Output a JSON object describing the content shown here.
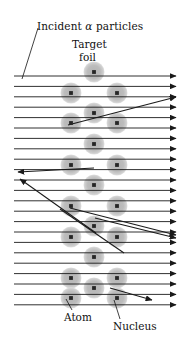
{
  "figure": {
    "labels": {
      "incident_prefix": "Incident ",
      "incident_symbol": "α",
      "incident_suffix": " particles",
      "target": "Target",
      "foil": "foil",
      "atom": "Atom",
      "nucleus": "Nucleus"
    },
    "colors": {
      "atom_fill": "#b9b9b9",
      "atom_halo": "#d0d0d0",
      "nucleus_fill": "#262626",
      "ray": "#1a1a1a",
      "background": "#ffffff",
      "text": "#111111"
    },
    "geometry": {
      "width": 190,
      "height": 345,
      "atom_radius": 10.5,
      "nucleus_radius": 1.9,
      "beam_left_x": 14,
      "beam_right_x": 176,
      "beam_first_y": 76,
      "beam_spacing": 10.4,
      "beam_count": 23,
      "lattice_columns_center": [
        94
      ],
      "lattice_columns_side": [
        71,
        117
      ],
      "lattice_first_row_y": 72,
      "lattice_row_spacing": 20.8,
      "lattice_row_count": 12
    },
    "beam_rows_y": [
      76,
      86.4,
      96.8,
      107.2,
      117.6,
      128,
      138.4,
      148.8,
      159.2,
      169.6,
      180,
      190.4,
      200.8,
      211.2,
      221.6,
      232,
      242.4,
      252.8,
      263.2,
      273.6,
      284,
      294.4,
      304.8
    ],
    "atoms": [
      {
        "cx": 94,
        "cy": 72,
        "row": 0,
        "kind": "center"
      },
      {
        "cx": 71,
        "cy": 93,
        "row": 1,
        "kind": "left"
      },
      {
        "cx": 117,
        "cy": 93,
        "row": 1,
        "kind": "right"
      },
      {
        "cx": 94,
        "cy": 113,
        "row": 2,
        "kind": "center"
      },
      {
        "cx": 71,
        "cy": 123,
        "row": 3,
        "kind": "left"
      },
      {
        "cx": 117,
        "cy": 123,
        "row": 3,
        "kind": "right"
      },
      {
        "cx": 94,
        "cy": 144,
        "row": 4,
        "kind": "center"
      },
      {
        "cx": 71,
        "cy": 165,
        "row": 5,
        "kind": "left"
      },
      {
        "cx": 117,
        "cy": 165,
        "row": 5,
        "kind": "right"
      },
      {
        "cx": 94,
        "cy": 185,
        "row": 6,
        "kind": "center"
      },
      {
        "cx": 71,
        "cy": 206,
        "row": 7,
        "kind": "left"
      },
      {
        "cx": 117,
        "cy": 206,
        "row": 7,
        "kind": "right"
      },
      {
        "cx": 94,
        "cy": 226,
        "row": 8,
        "kind": "center"
      },
      {
        "cx": 71,
        "cy": 237,
        "row": 9,
        "kind": "left"
      },
      {
        "cx": 117,
        "cy": 237,
        "row": 9,
        "kind": "right"
      },
      {
        "cx": 94,
        "cy": 257,
        "row": 10,
        "kind": "center"
      },
      {
        "cx": 71,
        "cy": 278,
        "row": 11,
        "kind": "left"
      },
      {
        "cx": 117,
        "cy": 278,
        "row": 11,
        "kind": "right"
      },
      {
        "cx": 94,
        "cy": 288,
        "row": 12,
        "kind": "center"
      },
      {
        "cx": 71,
        "cy": 298,
        "row": 13,
        "kind": "left"
      },
      {
        "cx": 117,
        "cy": 298,
        "row": 13,
        "kind": "right"
      }
    ],
    "scattered_rays": [
      {
        "name": "scatter-up-right",
        "from": [
          68,
          125
        ],
        "to": [
          176,
          97
        ],
        "arrow": true
      },
      {
        "name": "backscatter-upper",
        "from": [
          94,
          168
        ],
        "to": [
          18,
          172
        ],
        "arrow": true
      },
      {
        "name": "backscatter-lower",
        "from": [
          96,
          233
        ],
        "to": [
          20,
          179
        ],
        "arrow": true
      },
      {
        "name": "scatter-down-right-a",
        "from": [
          70,
          208
        ],
        "to": [
          176,
          235
        ],
        "arrow": true
      },
      {
        "name": "scatter-down-right-b",
        "from": [
          95,
          218
        ],
        "to": [
          176,
          238
        ],
        "arrow": true
      },
      {
        "name": "scatter-down-stop",
        "from": [
          60,
          209
        ],
        "to": [
          124,
          253
        ],
        "arrow": false
      },
      {
        "name": "scatter-bottom-right",
        "from": [
          110,
          288
        ],
        "to": [
          152,
          300
        ],
        "arrow": true
      }
    ],
    "leader_lines": [
      {
        "name": "leader-incident",
        "from": [
          38,
          28
        ],
        "to": [
          22,
          79
        ]
      },
      {
        "name": "leader-atom",
        "from": [
          72,
          310
        ],
        "to": [
          66,
          299
        ]
      },
      {
        "name": "leader-nucleus",
        "from": [
          120,
          319
        ],
        "to": [
          114,
          300
        ]
      }
    ]
  }
}
